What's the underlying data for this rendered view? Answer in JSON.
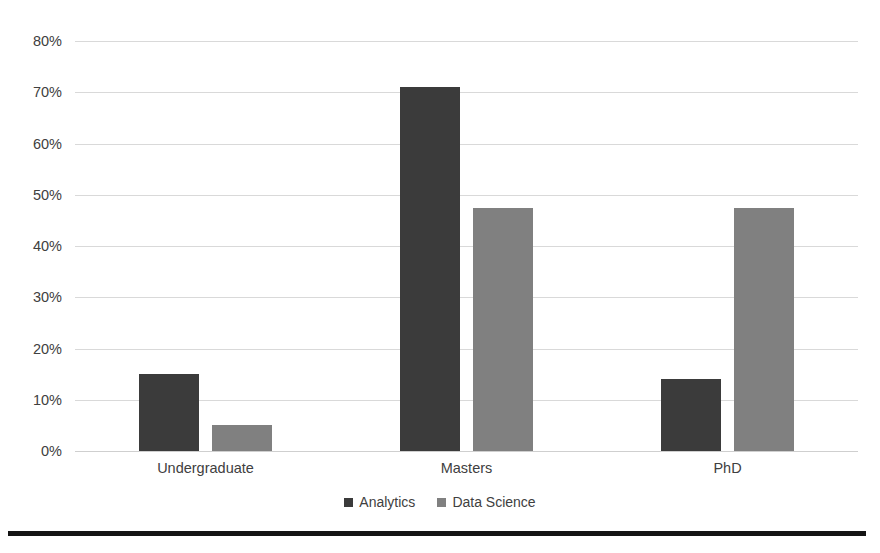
{
  "chart_data": {
    "type": "bar",
    "title": "",
    "subtitle": "",
    "xlabel": "",
    "ylabel": "",
    "categories": [
      "Undergraduate",
      "Masters",
      "PhD"
    ],
    "series": [
      {
        "name": "Analytics",
        "color": "#3b3b3b",
        "values": [
          15,
          71,
          14
        ]
      },
      {
        "name": "Data Science",
        "color": "#808080",
        "values": [
          5,
          47.5,
          47.5
        ]
      }
    ],
    "ylim": [
      0,
      80
    ],
    "ytick_step": 10,
    "ytick_labels": [
      "80%",
      "70%",
      "60%",
      "50%",
      "40%",
      "30%",
      "20%",
      "10%",
      "0%"
    ],
    "ytick_values": [
      80,
      70,
      60,
      50,
      40,
      30,
      20,
      10,
      0
    ],
    "grid": true,
    "grid_axis": "y",
    "legend": true,
    "legend_position": "bottom",
    "value_suffix": "%"
  },
  "legend": {
    "items": [
      {
        "label": "Analytics"
      },
      {
        "label": "Data Science"
      }
    ]
  },
  "colors": {
    "analytics": "#3b3b3b",
    "data_science": "#808080",
    "gridline": "#d9d9d9",
    "text": "#404040",
    "rule": "#141414",
    "background": "#ffffff"
  }
}
